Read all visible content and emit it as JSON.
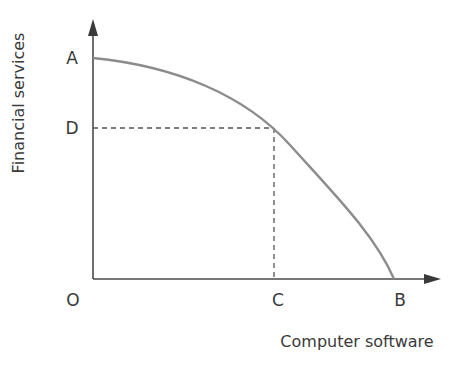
{
  "diagram": {
    "type": "production-possibility-frontier",
    "y_axis_label": "Financial services",
    "x_axis_label": "Computer software",
    "points": {
      "origin": "O",
      "y_intercept": "A",
      "y_mark": "D",
      "x_mark": "C",
      "x_intercept": "B"
    },
    "colors": {
      "axis": "#4a4a4a",
      "curve": "#8c8c8c",
      "dashed": "#555555",
      "text": "#3a3a3a"
    }
  }
}
